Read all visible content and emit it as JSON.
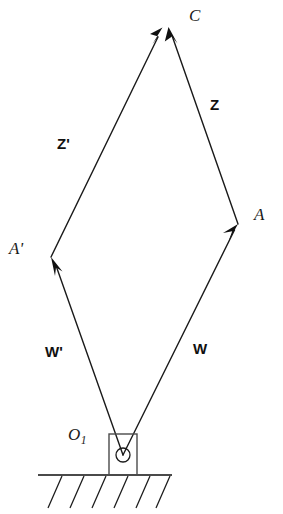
{
  "figure": {
    "kind": "four-bar-linkage-vector-diagram",
    "background_color": "#ffffff",
    "line_color": "#1a1a1a",
    "text_color": "#1a1a1a"
  },
  "points": {
    "C": {
      "label": "C",
      "x": 165,
      "y": 28
    },
    "A": {
      "label": "A",
      "x": 238,
      "y": 224
    },
    "Ap": {
      "label": "A'",
      "x": 51,
      "y": 257
    },
    "O1": {
      "label": "O",
      "subscript": "1",
      "x": 123,
      "y": 455
    }
  },
  "vectors": [
    {
      "name": "W",
      "label": "W",
      "from": "O1",
      "to": "A",
      "label_x": 205,
      "label_y": 350
    },
    {
      "name": "Z",
      "label": "Z",
      "from": "A",
      "to": "C",
      "label_x": 215,
      "label_y": 105
    },
    {
      "name": "W'",
      "label": "W'",
      "from": "O1",
      "to": "Ap",
      "label_x": 55,
      "label_y": 353
    },
    {
      "name": "Z'",
      "label": "Z'",
      "from": "Ap",
      "to": "C",
      "label_x": 63,
      "label_y": 145
    }
  ],
  "ground": {
    "line_y": 475,
    "line_x_start": 38,
    "line_x_end": 172,
    "hatch_count": 6
  },
  "pivot": {
    "box_left": 109,
    "box_top": 434,
    "box_width": 28,
    "box_height": 41,
    "circle_cx": 123,
    "circle_cy": 455,
    "circle_r": 7
  }
}
